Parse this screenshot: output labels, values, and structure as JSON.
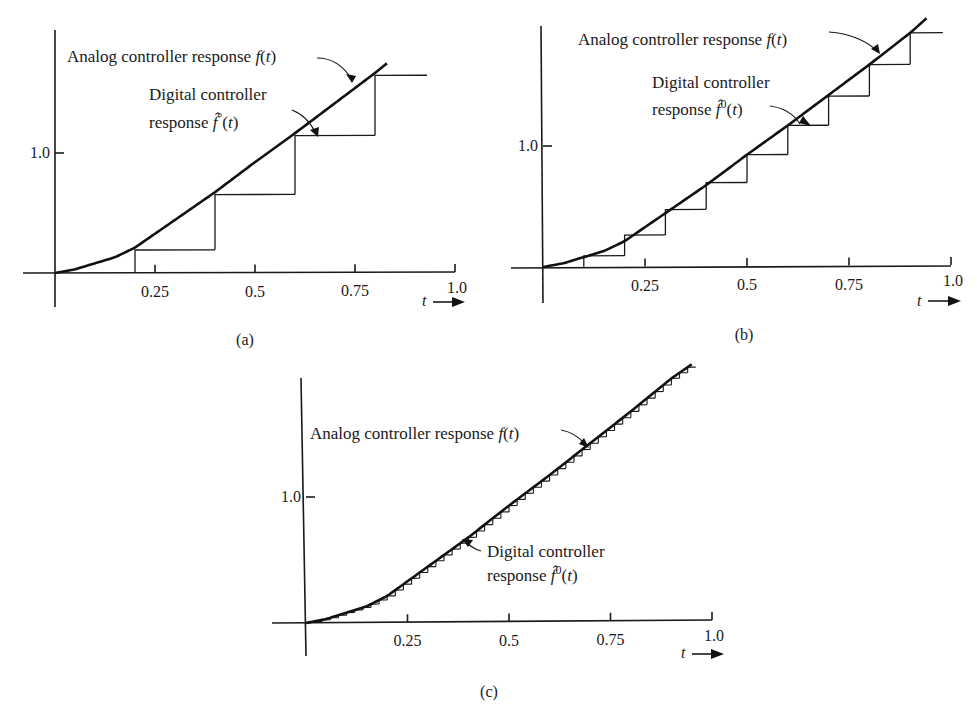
{
  "figure": {
    "panels": [
      "a",
      "b",
      "c"
    ]
  },
  "chart_data": [
    {
      "type": "line",
      "panel_label": "(a)",
      "title": "",
      "xlabel": "t",
      "ylabel": "",
      "xlim": [
        0,
        1.0
      ],
      "x_ticks": [
        0.25,
        0.5,
        0.75,
        1.0
      ],
      "x_tick_labels": [
        "0.25",
        "0.5",
        "0.75",
        "1.0"
      ],
      "y_ticks": [
        1.0
      ],
      "y_tick_labels": [
        "1.0"
      ],
      "grid": false,
      "series": [
        {
          "name": "Analog controller response f(t)",
          "kind": "curve",
          "x": [
            0,
            0.05,
            0.1,
            0.15,
            0.2,
            0.3,
            0.4,
            0.5,
            0.6,
            0.7,
            0.8,
            0.83
          ],
          "y": [
            0,
            0.03,
            0.08,
            0.13,
            0.21,
            0.44,
            0.67,
            0.92,
            1.16,
            1.41,
            1.66,
            1.74
          ]
        },
        {
          "name": "Digital controller response f^0(t)",
          "kind": "staircase",
          "sample_period": 0.2,
          "x": [
            0.2,
            0.4,
            0.6,
            0.8
          ],
          "y": [
            0.19,
            0.65,
            1.14,
            1.64
          ],
          "hold_until": 0.93
        }
      ],
      "annotations": [
        {
          "text_parts": [
            "Analog controller response ",
            "f",
            "(",
            "t",
            ")"
          ],
          "target": "analog"
        },
        {
          "line1": "Digital controller",
          "line2_parts": [
            "response ",
            "f̂",
            "°",
            "(",
            "t",
            ")"
          ],
          "target": "digital"
        }
      ]
    },
    {
      "type": "line",
      "panel_label": "(b)",
      "title": "",
      "xlabel": "t",
      "ylabel": "",
      "xlim": [
        0,
        1.0
      ],
      "x_ticks": [
        0.25,
        0.5,
        0.75,
        1.0
      ],
      "x_tick_labels": [
        "0.25",
        "0.5",
        "0.75",
        "1.0"
      ],
      "y_ticks": [
        1.0
      ],
      "y_tick_labels": [
        "1.0"
      ],
      "grid": false,
      "series": [
        {
          "name": "Analog controller response f(t)",
          "kind": "curve",
          "x": [
            0,
            0.05,
            0.1,
            0.15,
            0.2,
            0.3,
            0.4,
            0.5,
            0.6,
            0.7,
            0.8,
            0.9,
            0.94
          ],
          "y": [
            0,
            0.03,
            0.08,
            0.13,
            0.21,
            0.44,
            0.67,
            0.92,
            1.16,
            1.41,
            1.66,
            1.92,
            2.04
          ]
        },
        {
          "name": "Digital controller response f^0(t)",
          "kind": "staircase",
          "sample_period": 0.1,
          "x": [
            0.1,
            0.2,
            0.3,
            0.4,
            0.5,
            0.6,
            0.7,
            0.8,
            0.9
          ],
          "y": [
            0.09,
            0.26,
            0.47,
            0.69,
            0.92,
            1.16,
            1.4,
            1.66,
            1.92
          ],
          "hold_until": 0.98
        }
      ],
      "annotations": [
        {
          "text_parts": [
            "Analog controller response ",
            "f",
            "(",
            "t",
            ")"
          ],
          "target": "analog"
        },
        {
          "line1": "Digital controller",
          "line2_parts": [
            "response ",
            "f̂",
            "0",
            "(",
            "t",
            ")"
          ],
          "target": "digital"
        }
      ]
    },
    {
      "type": "line",
      "panel_label": "(c)",
      "title": "",
      "xlabel": "t",
      "ylabel": "",
      "xlim": [
        0,
        1.0
      ],
      "x_ticks": [
        0.25,
        0.5,
        0.75,
        1.0
      ],
      "x_tick_labels": [
        "0.25",
        "0.5",
        "0.75",
        "1.0"
      ],
      "y_ticks": [
        1.0
      ],
      "y_tick_labels": [
        "1.0"
      ],
      "grid": false,
      "series": [
        {
          "name": "Analog controller response f(t)",
          "kind": "curve",
          "x": [
            0,
            0.05,
            0.1,
            0.15,
            0.2,
            0.3,
            0.4,
            0.5,
            0.6,
            0.7,
            0.8,
            0.9,
            0.95
          ],
          "y": [
            0,
            0.03,
            0.08,
            0.13,
            0.21,
            0.44,
            0.67,
            0.92,
            1.16,
            1.41,
            1.66,
            1.92,
            2.03
          ]
        },
        {
          "name": "Digital controller response f^0(t)",
          "kind": "staircase",
          "sample_period": 0.02,
          "x_start": 0.02,
          "x_end": 0.95,
          "note": "levels follow f(t) sampled every 0.02"
        }
      ],
      "annotations": [
        {
          "text_parts": [
            "Analog controller response ",
            "f",
            "(",
            "t",
            ")"
          ],
          "target": "analog"
        },
        {
          "line1": "Digital controller",
          "line2_parts": [
            "response ",
            "f̂",
            "0",
            "(",
            "t",
            ")"
          ],
          "target": "digital"
        }
      ]
    }
  ]
}
